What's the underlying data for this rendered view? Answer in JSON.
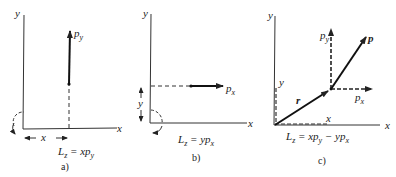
{
  "panels": [
    {
      "id": "a",
      "caption": "a)",
      "axis_x": "x",
      "axis_y": "y",
      "momentum_label": "p",
      "momentum_sub": "y",
      "distance_label": "x",
      "formula_L": "L",
      "formula_L_sub": "z",
      "formula_rhs": " = xp",
      "formula_rhs_sub": "y"
    },
    {
      "id": "b",
      "caption": "b)",
      "axis_x": "x",
      "axis_y": "y",
      "momentum_label": "p",
      "momentum_sub": "x",
      "distance_label": "y",
      "formula_L": "L",
      "formula_L_sub": "z",
      "formula_rhs": " = yp",
      "formula_rhs_sub": "x"
    },
    {
      "id": "c",
      "caption": "c)",
      "axis_x": "x",
      "axis_y": "y",
      "vector_r": "r",
      "vector_p": "p",
      "component_py": "p",
      "component_py_sub": "y",
      "component_px": "p",
      "component_px_sub": "x",
      "coord_x": "x",
      "coord_y": "y",
      "formula_L": "L",
      "formula_L_sub": "z",
      "formula_rhs1": " = xp",
      "formula_rhs1_sub": "y",
      "formula_rhs2": " − yp",
      "formula_rhs2_sub": "x"
    }
  ]
}
